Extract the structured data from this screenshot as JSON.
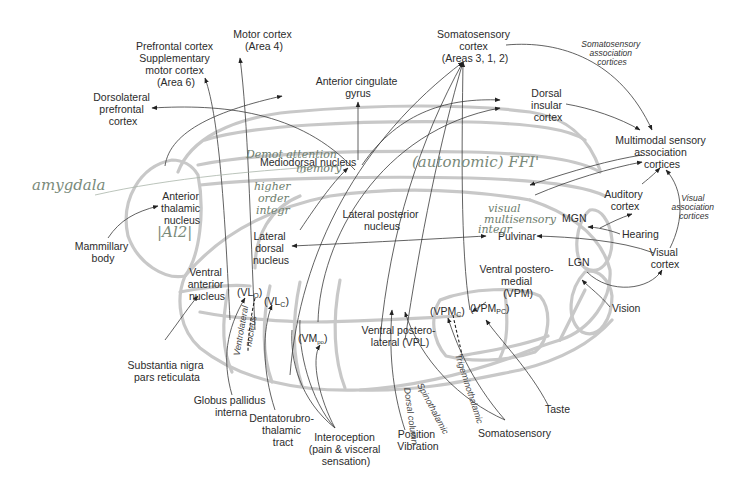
{
  "diagram": {
    "cortical_targets": {
      "prefrontal": [
        "Prefrontal cortex",
        "Supplementary",
        "motor cortex",
        "(Area 6)"
      ],
      "motor": [
        "Motor cortex",
        "(Area 4)"
      ],
      "somatosensory": [
        "Somatosensory",
        "cortex",
        "(Areas 3, 1, 2)"
      ],
      "somatosensory_assoc": [
        "Somatosensory",
        "association",
        "cortices"
      ],
      "dlpfc": [
        "Dorsolateral",
        "prefrontal",
        "cortex"
      ],
      "acg": [
        "Anterior cingulate",
        "gyrus"
      ],
      "insula": [
        "Dorsal",
        "insular",
        "cortex"
      ],
      "multimodal": [
        "Multimodal sensory",
        "association",
        "cortices"
      ],
      "auditory": [
        "Auditory",
        "cortex"
      ],
      "visual_assoc": [
        "Visual",
        "association",
        "cortices"
      ],
      "visual": [
        "Visual",
        "cortex"
      ]
    },
    "nuclei": {
      "anterior": [
        "Anterior",
        "thalamic",
        "nucleus"
      ],
      "mediodorsal": "Mediodorsal nucleus",
      "lateral_dorsal": [
        "Lateral",
        "dorsal",
        "nucleus"
      ],
      "lateral_posterior": [
        "Lateral posterior",
        "nucleus"
      ],
      "pulvinar": "Pulvinar",
      "mgn": "MGN",
      "lgn": "LGN",
      "ventral_anterior": [
        "Ventral",
        "anterior",
        "nucleus"
      ],
      "vlo": "(VL",
      "vlo_sub": "O",
      "vlc": "(VL",
      "vlc_sub": "C",
      "ventrolateral": [
        "Ventrolateral",
        "nucleus"
      ],
      "vmpo": "(VM",
      "vmpo_sub": "po",
      "vpl": [
        "Ventral postero-",
        "lateral (VPL)"
      ],
      "vpm": [
        "Ventral postero-",
        "medial",
        "(VPM)"
      ],
      "vpmc": "(VPM",
      "vpmc_sub": "C",
      "vpmpc": "(VPM",
      "vpmpc_sub": "PC"
    },
    "inputs": {
      "mammillary": [
        "Mammillary",
        "body"
      ],
      "snpr": [
        "Substantia nigra",
        "pars reticulata"
      ],
      "gpi": [
        "Globus pallidus",
        "interna"
      ],
      "dentato": [
        "Dentatorubro-",
        "thalamic",
        "tract"
      ],
      "interoception": [
        "Interoception",
        "(pain & visceral",
        "sensation)"
      ],
      "position": [
        "Position",
        "Vibration"
      ],
      "somatosensory": "Somatosensory",
      "taste": "Taste",
      "hearing": "Hearing",
      "vision": "Vision"
    },
    "tracts": {
      "dorsal_column": "Dorsal column",
      "spinothalamic": "Spinothalamic",
      "trigeminothalamic": "Trigeminothalamic"
    },
    "handwritten": {
      "amygdala": "amygdala",
      "al2": "|Al2|",
      "emotion": [
        "Demot  attention",
        "memory"
      ],
      "autonomic": "(autonomic) FFI'",
      "higher": [
        "higher",
        "order",
        "integr"
      ],
      "visual_multi": [
        "visual",
        "multisensory",
        "integr"
      ]
    }
  }
}
